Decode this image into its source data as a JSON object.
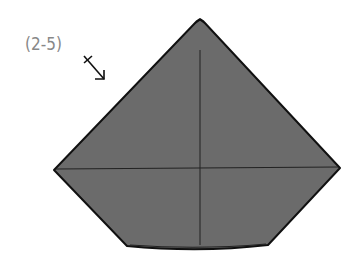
{
  "diagram": {
    "step_label": "(2-5)",
    "arrow_symbol": "fold-and-turn-over",
    "colors": {
      "paper": "#6b6b6b",
      "outline": "#111111",
      "label": "#888888",
      "background": "#ffffff"
    },
    "shape": {
      "apex": [
        200,
        20
      ],
      "left": [
        54,
        170
      ],
      "right": [
        340,
        168
      ],
      "bottom_left": [
        127,
        246
      ],
      "bottom_right": [
        268,
        245
      ],
      "bottom_mid": [
        200,
        251
      ]
    },
    "creases": [
      {
        "from": [
          56,
          169
        ],
        "to": [
          338,
          167
        ]
      },
      {
        "from": [
          200,
          50
        ],
        "to": [
          200,
          245
        ]
      }
    ]
  }
}
